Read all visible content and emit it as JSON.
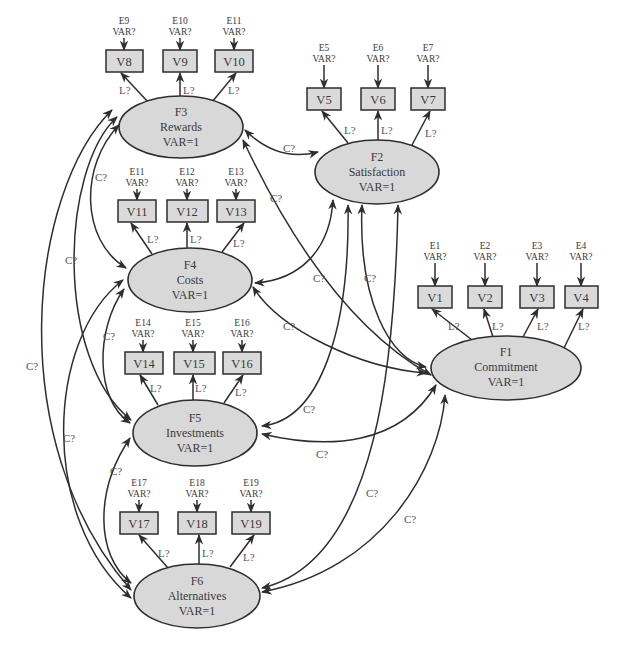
{
  "diagram": {
    "type": "structural-equation-model path diagram",
    "factor_variance_label": "VAR=1",
    "error_variance_label": "VAR?",
    "loading_label": "L?",
    "covariance_label": "C?",
    "factors": [
      {
        "id": "F1",
        "name": "Commitment",
        "var": "VAR=1",
        "cx": 506,
        "cy": 368,
        "rx": 75,
        "ry": 32
      },
      {
        "id": "F2",
        "name": "Satisfaction",
        "var": "VAR=1",
        "cx": 377,
        "cy": 172,
        "rx": 62,
        "ry": 32
      },
      {
        "id": "F3",
        "name": "Rewards",
        "var": "VAR=1",
        "cx": 181,
        "cy": 127,
        "rx": 62,
        "ry": 31
      },
      {
        "id": "F4",
        "name": "Costs",
        "var": "VAR=1",
        "cx": 190,
        "cy": 280,
        "rx": 62,
        "ry": 32
      },
      {
        "id": "F5",
        "name": "Investments",
        "var": "VAR=1",
        "cx": 195,
        "cy": 433,
        "rx": 62,
        "ry": 33
      },
      {
        "id": "F6",
        "name": "Alternatives",
        "var": "VAR=1",
        "cx": 197,
        "cy": 596,
        "rx": 63,
        "ry": 32
      }
    ],
    "observed": [
      {
        "id": "V1",
        "error": "E1",
        "factor": "F1",
        "x": 418,
        "y": 286,
        "w": 34,
        "h": 22
      },
      {
        "id": "V2",
        "error": "E2",
        "factor": "F1",
        "x": 468,
        "y": 286,
        "w": 34,
        "h": 22
      },
      {
        "id": "V3",
        "error": "E3",
        "factor": "F1",
        "x": 520,
        "y": 286,
        "w": 34,
        "h": 22
      },
      {
        "id": "V4",
        "error": "E4",
        "factor": "F1",
        "x": 565,
        "y": 286,
        "w": 33,
        "h": 22
      },
      {
        "id": "V5",
        "error": "E5",
        "factor": "F2",
        "x": 307,
        "y": 88,
        "w": 34,
        "h": 22
      },
      {
        "id": "V6",
        "error": "E6",
        "factor": "F2",
        "x": 361,
        "y": 88,
        "w": 34,
        "h": 22
      },
      {
        "id": "V7",
        "error": "E7",
        "factor": "F2",
        "x": 411,
        "y": 88,
        "w": 34,
        "h": 22
      },
      {
        "id": "V8",
        "error": "E8",
        "factor": "F3",
        "x": 106,
        "y": 50,
        "w": 37,
        "h": 22
      },
      {
        "id": "V9",
        "error": "E9",
        "factor": "F3",
        "x": 163,
        "y": 50,
        "w": 34,
        "h": 22
      },
      {
        "id": "V10",
        "error": "E10",
        "factor": "F3",
        "x": 215,
        "y": 50,
        "w": 38,
        "h": 22
      },
      {
        "id": "V11",
        "error": "E11",
        "factor": "F4",
        "x": 118,
        "y": 200,
        "w": 38,
        "h": 22
      },
      {
        "id": "V12",
        "error": "E12",
        "factor": "F4",
        "x": 167,
        "y": 200,
        "w": 41,
        "h": 22
      },
      {
        "id": "V13",
        "error": "E13",
        "factor": "F4",
        "x": 217,
        "y": 200,
        "w": 38,
        "h": 22
      },
      {
        "id": "V14",
        "error": "E14",
        "factor": "F5",
        "x": 125,
        "y": 352,
        "w": 38,
        "h": 22
      },
      {
        "id": "V15",
        "error": "E15",
        "factor": "F5",
        "x": 174,
        "y": 352,
        "w": 41,
        "h": 22
      },
      {
        "id": "V16",
        "error": "E16",
        "factor": "F5",
        "x": 223,
        "y": 352,
        "w": 38,
        "h": 22
      },
      {
        "id": "V17",
        "error": "E17",
        "factor": "F6",
        "x": 120,
        "y": 512,
        "w": 38,
        "h": 22
      },
      {
        "id": "V18",
        "error": "E18",
        "factor": "F6",
        "x": 178,
        "y": 512,
        "w": 38,
        "h": 22
      },
      {
        "id": "V19",
        "error": "E19",
        "factor": "F6",
        "x": 232,
        "y": 512,
        "w": 38,
        "h": 22
      }
    ],
    "covariances": [
      {
        "from": "F3",
        "to": "F2",
        "label": "C?"
      },
      {
        "from": "F3",
        "to": "F4",
        "label": "C?"
      },
      {
        "from": "F3",
        "to": "F5",
        "label": "C?"
      },
      {
        "from": "F3",
        "to": "F6",
        "label": "C?"
      },
      {
        "from": "F3",
        "to": "F1",
        "label": "C?"
      },
      {
        "from": "F2",
        "to": "F4",
        "label": "C?"
      },
      {
        "from": "F2",
        "to": "F5",
        "label": "C?"
      },
      {
        "from": "F2",
        "to": "F6",
        "label": "C?"
      },
      {
        "from": "F2",
        "to": "F1",
        "label": "C?"
      },
      {
        "from": "F4",
        "to": "F5",
        "label": "C?"
      },
      {
        "from": "F4",
        "to": "F6",
        "label": "C?"
      },
      {
        "from": "F4",
        "to": "F1",
        "label": "C?"
      },
      {
        "from": "F5",
        "to": "F6",
        "label": "C?"
      },
      {
        "from": "F5",
        "to": "F1",
        "label": "C?"
      },
      {
        "from": "F6",
        "to": "F1",
        "label": "C?"
      }
    ]
  }
}
